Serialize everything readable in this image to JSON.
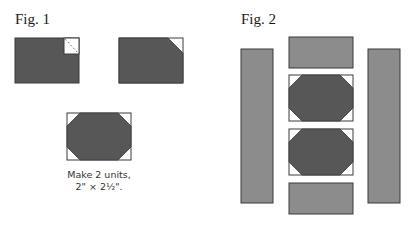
{
  "figure1": {
    "title": "Fig. 1",
    "caption_line1": "Make 2 units,",
    "caption_line2": "2\" × 2½\"."
  },
  "figure2": {
    "title": "Fig. 2"
  },
  "colors": {
    "dark_fabric": "#575757",
    "medium_fabric": "#8c8c8c",
    "light_fabric": "#ffffff",
    "outline": "#3a3a3a",
    "sewing_line": "#777777"
  }
}
